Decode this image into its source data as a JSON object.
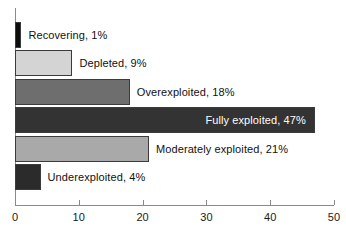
{
  "chart_data": {
    "type": "bar",
    "orientation": "horizontal",
    "title": "",
    "subtitle": "",
    "xlabel": "",
    "ylabel": "",
    "xlim": [
      0,
      50
    ],
    "ylim": null,
    "grid": false,
    "legend": null,
    "xticks": [
      "0",
      "10",
      "20",
      "30",
      "40",
      "50"
    ],
    "xtick_values": [
      0,
      10,
      20,
      30,
      40,
      50
    ],
    "categories": [
      "Recovering",
      "Depleted",
      "Overexploited",
      "Fully exploited",
      "Moderately exploited",
      "Underexploited"
    ],
    "values": [
      1,
      9,
      18,
      47,
      21,
      4
    ],
    "bars": [
      {
        "category": "Recovering",
        "value": 1,
        "label": "Recovering, 1%",
        "color": "#0d0d0d",
        "label_position": "outside",
        "label_color": "#111111"
      },
      {
        "category": "Depleted",
        "value": 9,
        "label": "Depleted, 9%",
        "color": "#d4d4d4",
        "label_position": "outside",
        "label_color": "#111111"
      },
      {
        "category": "Overexploited",
        "value": 18,
        "label": "Overexploited, 18%",
        "color": "#6e6e6e",
        "label_position": "outside",
        "label_color": "#111111"
      },
      {
        "category": "Fully exploited",
        "value": 47,
        "label": "Fully exploited, 47%",
        "color": "#333333",
        "label_position": "inside",
        "label_color": "#ffffff"
      },
      {
        "category": "Moderately exploited",
        "value": 21,
        "label": "Moderately exploited, 21%",
        "color": "#a9a9a9",
        "label_position": "outside",
        "label_color": "#111111"
      },
      {
        "category": "Underexploited",
        "value": 4,
        "label": "Underexploited, 4%",
        "color": "#2b2b2b",
        "label_position": "outside",
        "label_color": "#111111"
      }
    ],
    "axis_color": "#8a8a8a",
    "bar_outline_color": "#3b3b3b",
    "background_color": "#ffffff"
  }
}
